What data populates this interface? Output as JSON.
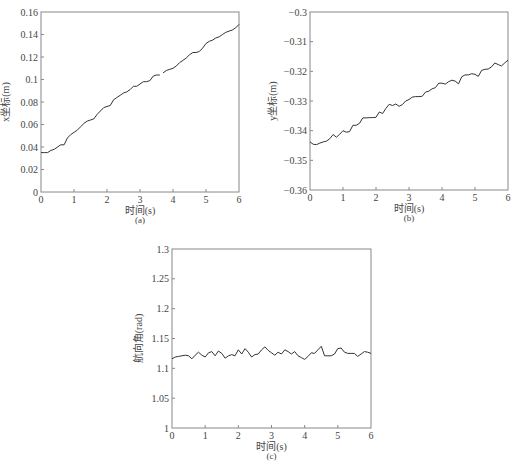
{
  "chart_data": [
    {
      "id": "a",
      "type": "line",
      "title": "",
      "caption": "(a)",
      "xlabel": "时间(s)",
      "ylabel": "x坐标(m)",
      "xlim": [
        0,
        6
      ],
      "ylim": [
        0,
        0.16
      ],
      "xticks": [
        "0",
        "1",
        "2",
        "3",
        "4",
        "5",
        "6"
      ],
      "yticks": [
        "0",
        "0.02",
        "0.04",
        "0.06",
        "0.08",
        "0.1",
        "0.12",
        "0.14",
        "0.16"
      ],
      "grid": false,
      "legend": null,
      "series": [
        {
          "name": "x坐标",
          "segments": [
            {
              "x": [
                0,
                0.1,
                0.2,
                0.3,
                0.4,
                0.5,
                0.6,
                0.7,
                0.8,
                0.9,
                1.0,
                1.1,
                1.2,
                1.3,
                1.4,
                1.5,
                1.6,
                1.7,
                1.8,
                1.9,
                2.0,
                2.1,
                2.2,
                2.3,
                2.4,
                2.5,
                2.6,
                2.7,
                2.8,
                2.9,
                3.0,
                3.1,
                3.2,
                3.3,
                3.4,
                3.5,
                3.6
              ],
              "y": [
                0.035,
                0.035,
                0.035,
                0.037,
                0.038,
                0.04,
                0.042,
                0.042,
                0.048,
                0.051,
                0.053,
                0.055,
                0.058,
                0.061,
                0.063,
                0.064,
                0.065,
                0.069,
                0.072,
                0.075,
                0.076,
                0.077,
                0.082,
                0.084,
                0.086,
                0.088,
                0.089,
                0.091,
                0.094,
                0.094,
                0.096,
                0.098,
                0.098,
                0.099,
                0.103,
                0.104,
                0.104
              ]
            },
            {
              "x": [
                3.7,
                3.8,
                3.9,
                4.0,
                4.1,
                4.2,
                4.3,
                4.4,
                4.5,
                4.6,
                4.7,
                4.8,
                4.9,
                5.0,
                5.1,
                5.2,
                5.3,
                5.4,
                5.5,
                5.6,
                5.7,
                5.8,
                5.9,
                6.0
              ],
              "y": [
                0.106,
                0.108,
                0.109,
                0.11,
                0.112,
                0.115,
                0.117,
                0.119,
                0.122,
                0.124,
                0.124,
                0.125,
                0.128,
                0.132,
                0.134,
                0.135,
                0.137,
                0.138,
                0.14,
                0.142,
                0.143,
                0.144,
                0.146,
                0.149
              ]
            }
          ]
        }
      ]
    },
    {
      "id": "b",
      "type": "line",
      "title": "",
      "caption": "(b)",
      "xlabel": "时间(s)",
      "ylabel": "y坐标(m)",
      "xlim": [
        0,
        6
      ],
      "ylim": [
        -0.36,
        -0.3
      ],
      "xticks": [
        "0",
        "1",
        "2",
        "3",
        "4",
        "5",
        "6"
      ],
      "yticks": [
        "-0.36",
        "-0.35",
        "-0.34",
        "-0.33",
        "-0.32",
        "-0.31",
        "-0.3"
      ],
      "grid": false,
      "legend": null,
      "series": [
        {
          "name": "y坐标",
          "segments": [
            {
              "x": [
                0,
                0.1,
                0.2,
                0.3,
                0.4,
                0.5,
                0.6,
                0.7,
                0.8,
                0.9,
                1.0,
                1.1,
                1.2,
                1.3,
                1.4,
                1.5,
                1.6,
                1.7,
                1.8,
                1.9,
                2.0,
                2.1,
                2.2,
                2.3,
                2.4,
                2.5,
                2.6,
                2.7,
                2.8,
                2.9,
                3.0,
                3.1,
                3.2,
                3.3,
                3.4,
                3.5,
                3.6,
                3.7,
                3.8,
                3.9,
                4.0,
                4.1,
                4.2,
                4.3,
                4.4,
                4.5,
                4.6,
                4.7,
                4.8,
                4.9,
                5.0,
                5.1,
                5.2,
                5.3,
                5.4,
                5.5,
                5.6,
                5.7,
                5.8,
                5.9,
                6.0
              ],
              "y": [
                -0.3438,
                -0.3446,
                -0.3447,
                -0.3442,
                -0.3438,
                -0.3435,
                -0.3427,
                -0.3413,
                -0.3422,
                -0.3412,
                -0.34,
                -0.3405,
                -0.3403,
                -0.3382,
                -0.3382,
                -0.3375,
                -0.3357,
                -0.3357,
                -0.3356,
                -0.3356,
                -0.3355,
                -0.3337,
                -0.3342,
                -0.3325,
                -0.3311,
                -0.3315,
                -0.331,
                -0.3318,
                -0.3312,
                -0.33,
                -0.3295,
                -0.3287,
                -0.3285,
                -0.3285,
                -0.3284,
                -0.327,
                -0.3267,
                -0.3259,
                -0.3255,
                -0.324,
                -0.324,
                -0.3243,
                -0.3235,
                -0.323,
                -0.3233,
                -0.3242,
                -0.3218,
                -0.3212,
                -0.3212,
                -0.3208,
                -0.321,
                -0.3217,
                -0.3197,
                -0.3193,
                -0.3192,
                -0.3185,
                -0.3172,
                -0.3177,
                -0.3182,
                -0.3172,
                -0.3162
              ]
            }
          ]
        }
      ]
    },
    {
      "id": "c",
      "type": "line",
      "title": "",
      "caption": "(c)",
      "xlabel": "时间(s)",
      "ylabel": "航向角(rad)",
      "xlim": [
        0,
        6
      ],
      "ylim": [
        1,
        1.3
      ],
      "xticks": [
        "0",
        "1",
        "2",
        "3",
        "4",
        "5",
        "6"
      ],
      "yticks": [
        "1",
        "1.05",
        "1.1",
        "1.15",
        "1.2",
        "1.25",
        "1.3"
      ],
      "grid": false,
      "legend": null,
      "series": [
        {
          "name": "航向角",
          "segments": [
            {
              "x": [
                0,
                0.1,
                0.2,
                0.3,
                0.4,
                0.5,
                0.6,
                0.7,
                0.8,
                0.9,
                1.0,
                1.1,
                1.2,
                1.3,
                1.4,
                1.5,
                1.6,
                1.7,
                1.8,
                1.9,
                2.0,
                2.1,
                2.2,
                2.3,
                2.4,
                2.5,
                2.6,
                2.7,
                2.8,
                2.9,
                3.0,
                3.1,
                3.2,
                3.3,
                3.4,
                3.5,
                3.6,
                3.7,
                3.8,
                3.9,
                4.0,
                4.1,
                4.2,
                4.3,
                4.4,
                4.5,
                4.6,
                4.7,
                4.8,
                4.9,
                5.0,
                5.1,
                5.2,
                5.3,
                5.4,
                5.5,
                5.6,
                5.7,
                5.8,
                5.9,
                6.0
              ],
              "y": [
                1.116,
                1.119,
                1.12,
                1.121,
                1.122,
                1.121,
                1.116,
                1.122,
                1.127,
                1.122,
                1.119,
                1.126,
                1.128,
                1.121,
                1.129,
                1.125,
                1.117,
                1.121,
                1.123,
                1.121,
                1.131,
                1.124,
                1.133,
                1.127,
                1.119,
                1.123,
                1.124,
                1.131,
                1.136,
                1.13,
                1.126,
                1.122,
                1.127,
                1.124,
                1.131,
                1.128,
                1.124,
                1.128,
                1.121,
                1.118,
                1.115,
                1.12,
                1.126,
                1.125,
                1.131,
                1.137,
                1.121,
                1.121,
                1.121,
                1.124,
                1.133,
                1.134,
                1.127,
                1.125,
                1.125,
                1.125,
                1.12,
                1.124,
                1.128,
                1.127,
                1.125
              ]
            }
          ]
        }
      ]
    }
  ],
  "layout": {
    "panels": [
      {
        "id": "a",
        "frame": {
          "left": 41,
          "top": 12,
          "right": 239,
          "bottom": 192
        }
      },
      {
        "id": "b",
        "frame": {
          "left": 310,
          "top": 12,
          "right": 508,
          "bottom": 190
        }
      },
      {
        "id": "c",
        "frame": {
          "left": 172,
          "top": 249,
          "right": 371,
          "bottom": 428
        }
      }
    ],
    "colors": {
      "line": "#333333",
      "axis": "#888888",
      "text": "#444444",
      "background": "#ffffff"
    }
  }
}
